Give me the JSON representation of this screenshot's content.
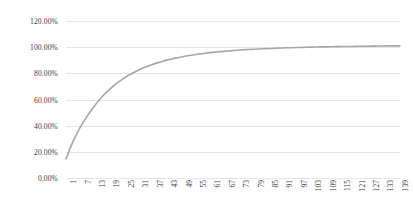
{
  "chart_data": {
    "type": "line",
    "title": "",
    "subtitle": "",
    "xlabel": "",
    "ylabel": "",
    "grid": true,
    "legend": false,
    "legend_position": "none",
    "line_color": "#a6a6a6",
    "background_color": "#ffffff",
    "gridline_color": "#e6e6e6",
    "axis_text_color": "#3a3a3a",
    "ylim": [
      0,
      120
    ],
    "y_ticks": [
      0,
      20,
      40,
      60,
      80,
      100,
      120
    ],
    "y_tick_labels": [
      "0.00%",
      "20.00%",
      "40.00%",
      "60.00%",
      "80.00%",
      "100.00%",
      "120.00%"
    ],
    "y_unit": "percent",
    "xlim": [
      1,
      140
    ],
    "x_tick_labels": [
      "1",
      "7",
      "13",
      "19",
      "25",
      "31",
      "37",
      "43",
      "49",
      "55",
      "61",
      "67",
      "73",
      "79",
      "85",
      "91",
      "97",
      "103",
      "109",
      "115",
      "121",
      "127",
      "133",
      "139"
    ],
    "x_tick_step": 6,
    "x_tick_rotation": -90,
    "n_points": 140,
    "series": [
      {
        "name": "cumulative",
        "x": [
          1,
          3,
          5,
          7,
          9,
          11,
          13,
          15,
          17,
          19,
          21,
          23,
          25,
          27,
          29,
          31,
          33,
          35,
          37,
          39,
          41,
          43,
          45,
          47,
          49,
          51,
          53,
          55,
          57,
          59,
          61,
          63,
          65,
          67,
          69,
          71,
          73,
          75,
          77,
          79,
          81,
          83,
          85,
          87,
          89,
          91,
          93,
          95,
          97,
          99,
          101,
          103,
          105,
          107,
          109,
          111,
          113,
          115,
          117,
          119,
          121,
          123,
          125,
          127,
          129,
          131,
          133,
          135,
          137,
          139,
          140
        ],
        "values": [
          14.5,
          24.0,
          32.0,
          39.0,
          45.0,
          50.5,
          55.5,
          60.0,
          64.0,
          67.5,
          70.8,
          73.6,
          76.2,
          78.5,
          80.5,
          82.3,
          84.0,
          85.5,
          86.8,
          88.0,
          89.1,
          90.1,
          91.0,
          91.8,
          92.5,
          93.2,
          93.8,
          94.4,
          94.9,
          95.4,
          95.8,
          96.2,
          96.6,
          96.9,
          97.2,
          97.5,
          97.8,
          98.0,
          98.2,
          98.4,
          98.6,
          98.8,
          98.95,
          99.1,
          99.25,
          99.4,
          99.5,
          99.6,
          99.7,
          99.8,
          99.9,
          100.0,
          100.1,
          100.2,
          100.25,
          100.3,
          100.4,
          100.45,
          100.5,
          100.55,
          100.6,
          100.65,
          100.7,
          100.75,
          100.8,
          100.85,
          100.9,
          100.95,
          101.0,
          101.0,
          101.0
        ]
      }
    ]
  }
}
